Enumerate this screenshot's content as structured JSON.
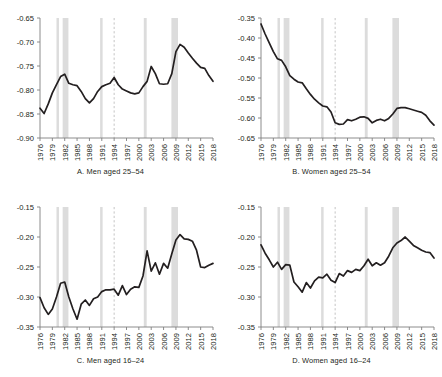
{
  "figure": {
    "background": "#ffffff",
    "series_color": "#231f20",
    "recession_band_color": "#dcdcdc",
    "reference_line_color": "#b4b4b4",
    "axis_color": "#808080"
  },
  "chart_data": [
    {
      "type": "line",
      "panel": "A",
      "title": "A. Men aged 25–54",
      "xlabel": "",
      "ylabel": "",
      "xlim": [
        1976,
        2018
      ],
      "ylim": [
        -0.9,
        -0.65
      ],
      "yticks": [
        -0.65,
        -0.7,
        -0.75,
        -0.8,
        -0.85,
        -0.9
      ],
      "ytick_labels": [
        "-0.65",
        "-0.70",
        "-0.75",
        "-0.80",
        "-0.85",
        "-0.90"
      ],
      "xticks": [
        1976,
        1979,
        1982,
        1985,
        1988,
        1991,
        1994,
        1997,
        2000,
        2003,
        2006,
        2009,
        2012,
        2015,
        2018
      ],
      "xtick_labels": [
        "1976",
        "1979",
        "1982",
        "1985",
        "1988",
        "1991",
        "1994",
        "1997",
        "2000",
        "2003",
        "2006",
        "2009",
        "2012",
        "2015",
        "2018"
      ],
      "grid": false,
      "legend": null,
      "recession_bands": [
        [
          1980.0,
          1980.6
        ],
        [
          1981.5,
          1982.9
        ],
        [
          1990.6,
          1991.2
        ],
        [
          2001.2,
          2001.9
        ],
        [
          2007.9,
          2009.5
        ]
      ],
      "reference_line_x": 1994,
      "x": [
        1976,
        1977,
        1978,
        1979,
        1980,
        1981,
        1982,
        1983,
        1984,
        1985,
        1986,
        1987,
        1988,
        1989,
        1990,
        1991,
        1992,
        1993,
        1994,
        1995,
        1996,
        1997,
        1998,
        1999,
        2000,
        2001,
        2002,
        2003,
        2004,
        2005,
        2006,
        2007,
        2008,
        2009,
        2010,
        2011,
        2012,
        2013,
        2014,
        2015,
        2016,
        2017,
        2018
      ],
      "values": [
        -0.838,
        -0.849,
        -0.829,
        -0.806,
        -0.789,
        -0.772,
        -0.767,
        -0.786,
        -0.789,
        -0.791,
        -0.803,
        -0.818,
        -0.827,
        -0.818,
        -0.803,
        -0.793,
        -0.789,
        -0.786,
        -0.774,
        -0.789,
        -0.798,
        -0.802,
        -0.806,
        -0.808,
        -0.806,
        -0.793,
        -0.782,
        -0.751,
        -0.766,
        -0.787,
        -0.788,
        -0.787,
        -0.766,
        -0.72,
        -0.705,
        -0.711,
        -0.723,
        -0.734,
        -0.744,
        -0.753,
        -0.755,
        -0.77,
        -0.782
      ]
    },
    {
      "type": "line",
      "panel": "B",
      "title": "B. Women aged 25–54",
      "xlabel": "",
      "ylabel": "",
      "xlim": [
        1976,
        2018
      ],
      "ylim": [
        -0.65,
        -0.35
      ],
      "yticks": [
        -0.35,
        -0.4,
        -0.45,
        -0.5,
        -0.55,
        -0.6,
        -0.65
      ],
      "ytick_labels": [
        "-0.35",
        "-0.40",
        "-0.45",
        "-0.50",
        "-0.55",
        "-0.60",
        "-0.65"
      ],
      "xticks": [
        1976,
        1979,
        1982,
        1985,
        1988,
        1991,
        1994,
        1997,
        2000,
        2003,
        2006,
        2009,
        2012,
        2015,
        2018
      ],
      "xtick_labels": [
        "1976",
        "1979",
        "1982",
        "1985",
        "1988",
        "1991",
        "1994",
        "1997",
        "2000",
        "2003",
        "2006",
        "2009",
        "2012",
        "2015",
        "2018"
      ],
      "grid": false,
      "legend": null,
      "recession_bands": [
        [
          1980.0,
          1980.6
        ],
        [
          1981.5,
          1982.9
        ],
        [
          1990.6,
          1991.2
        ],
        [
          2001.2,
          2001.9
        ],
        [
          2007.9,
          2009.5
        ]
      ],
      "reference_line_x": 1994,
      "x": [
        1976,
        1977,
        1978,
        1979,
        1980,
        1981,
        1982,
        1983,
        1984,
        1985,
        1986,
        1987,
        1988,
        1989,
        1990,
        1991,
        1992,
        1993,
        1994,
        1995,
        1996,
        1997,
        1998,
        1999,
        2000,
        2001,
        2002,
        2003,
        2004,
        2005,
        2006,
        2007,
        2008,
        2009,
        2010,
        2011,
        2012,
        2013,
        2014,
        2015,
        2016,
        2017,
        2018
      ],
      "values": [
        -0.365,
        -0.39,
        -0.412,
        -0.434,
        -0.452,
        -0.456,
        -0.472,
        -0.494,
        -0.503,
        -0.51,
        -0.512,
        -0.527,
        -0.541,
        -0.553,
        -0.562,
        -0.57,
        -0.572,
        -0.585,
        -0.612,
        -0.616,
        -0.615,
        -0.604,
        -0.607,
        -0.603,
        -0.598,
        -0.597,
        -0.601,
        -0.612,
        -0.606,
        -0.603,
        -0.607,
        -0.601,
        -0.59,
        -0.576,
        -0.574,
        -0.574,
        -0.577,
        -0.58,
        -0.583,
        -0.586,
        -0.593,
        -0.607,
        -0.618
      ]
    },
    {
      "type": "line",
      "panel": "C",
      "title": "C. Men aged 16–24",
      "xlabel": "",
      "ylabel": "",
      "xlim": [
        1976,
        2018
      ],
      "ylim": [
        -0.35,
        -0.15
      ],
      "yticks": [
        -0.15,
        -0.2,
        -0.25,
        -0.3,
        -0.35
      ],
      "ytick_labels": [
        "-0.15",
        "-0.20",
        "-0.25",
        "-0.30",
        "-0.35"
      ],
      "xticks": [
        1976,
        1979,
        1982,
        1985,
        1988,
        1991,
        1994,
        1997,
        2000,
        2003,
        2006,
        2009,
        2012,
        2015,
        2018
      ],
      "xtick_labels": [
        "1976",
        "1979",
        "1982",
        "1985",
        "1988",
        "1991",
        "1994",
        "1997",
        "2000",
        "2003",
        "2006",
        "2009",
        "2012",
        "2015",
        "2018"
      ],
      "grid": false,
      "legend": null,
      "recession_bands": [
        [
          1980.0,
          1980.6
        ],
        [
          1981.5,
          1982.9
        ],
        [
          1990.6,
          1991.2
        ],
        [
          2001.2,
          2001.9
        ],
        [
          2007.9,
          2009.5
        ]
      ],
      "reference_line_x": 1994,
      "x": [
        1976,
        1977,
        1978,
        1979,
        1980,
        1981,
        1982,
        1983,
        1984,
        1985,
        1986,
        1987,
        1988,
        1989,
        1990,
        1991,
        1992,
        1993,
        1994,
        1995,
        1996,
        1997,
        1998,
        1999,
        2000,
        2001,
        2002,
        2003,
        2004,
        2005,
        2006,
        2007,
        2008,
        2009,
        2010,
        2011,
        2012,
        2013,
        2014,
        2015,
        2016,
        2017,
        2018
      ],
      "values": [
        -0.301,
        -0.318,
        -0.329,
        -0.32,
        -0.3,
        -0.277,
        -0.275,
        -0.3,
        -0.32,
        -0.337,
        -0.312,
        -0.305,
        -0.314,
        -0.303,
        -0.3,
        -0.291,
        -0.288,
        -0.288,
        -0.287,
        -0.297,
        -0.281,
        -0.296,
        -0.287,
        -0.283,
        -0.284,
        -0.265,
        -0.223,
        -0.257,
        -0.243,
        -0.262,
        -0.244,
        -0.252,
        -0.228,
        -0.205,
        -0.196,
        -0.203,
        -0.204,
        -0.207,
        -0.222,
        -0.25,
        -0.251,
        -0.247,
        -0.244
      ]
    },
    {
      "type": "line",
      "panel": "D",
      "title": "D. Women aged 16–24",
      "xlabel": "",
      "ylabel": "",
      "xlim": [
        1976,
        2018
      ],
      "ylim": [
        -0.35,
        -0.15
      ],
      "yticks": [
        -0.15,
        -0.2,
        -0.25,
        -0.3,
        -0.35
      ],
      "ytick_labels": [
        "-0.15",
        "-0.20",
        "-0.25",
        "-0.30",
        "-0.35"
      ],
      "xticks": [
        1976,
        1979,
        1982,
        1985,
        1988,
        1991,
        1994,
        1997,
        2000,
        2003,
        2006,
        2009,
        2012,
        2015,
        2018
      ],
      "xtick_labels": [
        "1976",
        "1979",
        "1982",
        "1985",
        "1988",
        "1991",
        "1994",
        "1997",
        "2000",
        "2003",
        "2006",
        "2009",
        "2012",
        "2015",
        "2018"
      ],
      "grid": false,
      "legend": null,
      "recession_bands": [
        [
          1980.0,
          1980.6
        ],
        [
          1981.5,
          1982.9
        ],
        [
          1990.6,
          1991.2
        ],
        [
          2001.2,
          2001.9
        ],
        [
          2007.9,
          2009.5
        ]
      ],
      "reference_line_x": 1994,
      "x": [
        1976,
        1977,
        1978,
        1979,
        1980,
        1981,
        1982,
        1983,
        1984,
        1985,
        1986,
        1987,
        1988,
        1989,
        1990,
        1991,
        1992,
        1993,
        1994,
        1995,
        1996,
        1997,
        1998,
        1999,
        2000,
        2001,
        2002,
        2003,
        2004,
        2005,
        2006,
        2007,
        2008,
        2009,
        2010,
        2011,
        2012,
        2013,
        2014,
        2015,
        2016,
        2017,
        2018
      ],
      "values": [
        -0.213,
        -0.227,
        -0.238,
        -0.25,
        -0.242,
        -0.254,
        -0.246,
        -0.247,
        -0.275,
        -0.283,
        -0.292,
        -0.276,
        -0.285,
        -0.273,
        -0.267,
        -0.268,
        -0.262,
        -0.272,
        -0.276,
        -0.261,
        -0.265,
        -0.256,
        -0.259,
        -0.254,
        -0.256,
        -0.248,
        -0.237,
        -0.248,
        -0.243,
        -0.247,
        -0.243,
        -0.232,
        -0.218,
        -0.21,
        -0.206,
        -0.2,
        -0.207,
        -0.214,
        -0.218,
        -0.222,
        -0.225,
        -0.226,
        -0.235
      ]
    }
  ]
}
